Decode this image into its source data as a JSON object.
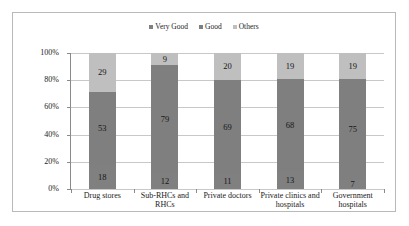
{
  "chart_data": {
    "type": "bar",
    "subtype": "stacked-100-percent",
    "title": "",
    "xlabel": "",
    "ylabel": "",
    "ylim": [
      0,
      100
    ],
    "ytick_labels": [
      "0%",
      "20%",
      "40%",
      "60%",
      "80%",
      "100%"
    ],
    "ytick_values": [
      0,
      20,
      40,
      60,
      80,
      100
    ],
    "grid": true,
    "legend_position": "top-center",
    "categories": [
      "Drug stores",
      "Sub-RHCs and RHCs",
      "Private doctors",
      "Private clinics and hospitals",
      "Government hospitals"
    ],
    "series": [
      {
        "name": "Very Good",
        "color": "#808080",
        "values": [
          18,
          12,
          11,
          13,
          7
        ]
      },
      {
        "name": "Good",
        "color": "#7f7f7f",
        "values": [
          53,
          79,
          69,
          68,
          75
        ]
      },
      {
        "name": "Others",
        "color": "#bfbfbf",
        "values": [
          29,
          9,
          20,
          19,
          19
        ]
      }
    ]
  },
  "colors": {
    "frame_border": "#b9b9b9",
    "gridline": "#c8c8c8",
    "axis": "#8a8a8a",
    "background": "#ffffff",
    "very_good": "#808080",
    "good": "#7f7f7f",
    "others": "#bfbfbf",
    "label_text": "#161616"
  }
}
